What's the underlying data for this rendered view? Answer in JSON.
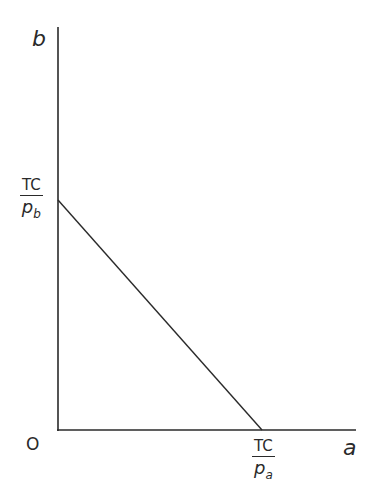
{
  "diagram": {
    "y_axis_label": "b",
    "x_axis_label": "a",
    "origin_label": "O",
    "y_intercept": {
      "numerator": "TC",
      "denominator": "p",
      "subscript": "b"
    },
    "x_intercept": {
      "numerator": "TC",
      "denominator": "p",
      "subscript": "a"
    },
    "line_color": "#2a2a2a"
  }
}
